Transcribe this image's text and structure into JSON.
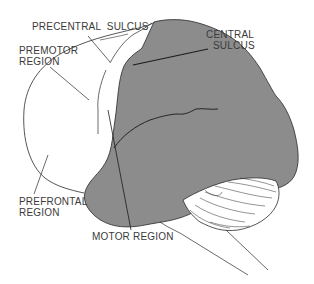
{
  "diagram": {
    "colors": {
      "background": "#ffffff",
      "shaded_region": "#8c8c8c",
      "outline": "#2a2a2a",
      "label_text": "#3a3a3a"
    },
    "labels": {
      "precentral_sulcus": "PRECENTRAL  SULCUS",
      "central_sulcus_line1": "CENTRAL",
      "central_sulcus_line2": "SULCUS",
      "premotor_line1": "PREMOTOR",
      "premotor_line2": "REGION",
      "prefrontal_line1": "PREFRONTAL",
      "prefrontal_line2": "REGION",
      "motor_region": "MOTOR REGION"
    }
  }
}
